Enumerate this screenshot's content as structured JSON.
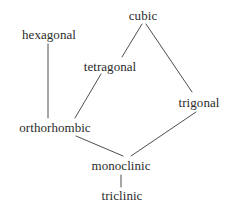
{
  "diagram": {
    "type": "graph",
    "title": "",
    "background_color": "#ffffff",
    "text_color": "#2b2b2b",
    "edge_color": "#3a3a3a",
    "width": 231,
    "height": 206,
    "nodes": [
      {
        "id": "cubic",
        "label": "cubic",
        "cx": 143,
        "cy": 15
      },
      {
        "id": "hexagonal",
        "label": "hexagonal",
        "cx": 49,
        "cy": 34
      },
      {
        "id": "tetragonal",
        "label": "tetragonal",
        "cx": 110,
        "cy": 66
      },
      {
        "id": "trigonal",
        "label": "trigonal",
        "cx": 199,
        "cy": 102
      },
      {
        "id": "orthorhombic",
        "label": "orthorhombic",
        "cx": 55,
        "cy": 127
      },
      {
        "id": "monoclinic",
        "label": "monoclinic",
        "cx": 121,
        "cy": 165
      },
      {
        "id": "triclinic",
        "label": "triclinic",
        "cx": 122,
        "cy": 195
      }
    ],
    "edges": [
      {
        "id": "cubic-tetragonal",
        "from": "cubic",
        "to": "tetragonal",
        "x1": 142,
        "y1": 24,
        "x2": 122,
        "y2": 57
      },
      {
        "id": "cubic-trigonal",
        "from": "cubic",
        "to": "trigonal",
        "x1": 146,
        "y1": 24,
        "x2": 192,
        "y2": 92
      },
      {
        "id": "hexagonal-orthorhombic",
        "from": "hexagonal",
        "to": "orthorhombic",
        "x1": 48,
        "y1": 44,
        "x2": 48,
        "y2": 118
      },
      {
        "id": "tetragonal-orthorhombic",
        "from": "tetragonal",
        "to": "orthorhombic",
        "x1": 101,
        "y1": 74,
        "x2": 75,
        "y2": 118
      },
      {
        "id": "orthorhombic-monoclinic",
        "from": "orthorhombic",
        "to": "monoclinic",
        "x1": 76,
        "y1": 136,
        "x2": 123,
        "y2": 156
      },
      {
        "id": "trigonal-monoclinic",
        "from": "trigonal",
        "to": "monoclinic",
        "x1": 196,
        "y1": 112,
        "x2": 131,
        "y2": 156
      },
      {
        "id": "monoclinic-triclinic",
        "from": "monoclinic",
        "to": "triclinic",
        "x1": 121,
        "y1": 175,
        "x2": 121,
        "y2": 187
      }
    ]
  }
}
